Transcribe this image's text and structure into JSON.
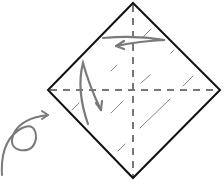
{
  "diagram": {
    "type": "origami-fold-step",
    "caption": "",
    "colors": {
      "outline": "#111111",
      "crease": "#777777",
      "arrow": "#7a7a7a",
      "hatch": "#666666",
      "background": "#ffffff"
    },
    "square": {
      "top": [
        133,
        3
      ],
      "right": [
        220,
        90
      ],
      "bottom": [
        133,
        178
      ],
      "left": [
        48,
        90
      ]
    },
    "creases": [
      {
        "name": "vertical-valley-fold",
        "from": [
          133,
          4
        ],
        "to": [
          133,
          177
        ],
        "style": "dashed"
      },
      {
        "name": "horizontal-valley-fold",
        "from": [
          49,
          90
        ],
        "to": [
          219,
          90
        ],
        "style": "dashed"
      }
    ],
    "arrows": [
      {
        "name": "fold-top-arrow",
        "meaning": "fold left"
      },
      {
        "name": "fold-left-arrow",
        "meaning": "fold and unfold"
      },
      {
        "name": "turn-over-arrow",
        "meaning": "turn over"
      }
    ]
  }
}
